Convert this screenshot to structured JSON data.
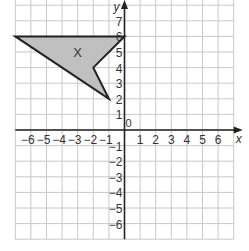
{
  "chart_data": {
    "type": "scatter",
    "title": "",
    "xlabel": "x",
    "ylabel": "y",
    "xlim": [
      -7,
      7
    ],
    "ylim": [
      -7,
      8
    ],
    "grid": true,
    "x_ticks": [
      -6,
      -5,
      -4,
      -3,
      -2,
      -1,
      1,
      2,
      3,
      4,
      5,
      6
    ],
    "y_ticks": [
      -6,
      -5,
      -4,
      -3,
      -2,
      -1,
      1,
      2,
      3,
      4,
      5,
      6,
      7
    ],
    "origin_label": "0",
    "shapes": [
      {
        "name": "X",
        "label": "X",
        "vertices": [
          [
            -7,
            6
          ],
          [
            0,
            6
          ],
          [
            -2,
            4
          ],
          [
            -1,
            2
          ]
        ],
        "fill": "#c0c0c0",
        "stroke": "#222222",
        "label_pos": [
          -3,
          5
        ]
      }
    ]
  },
  "colors": {
    "grid": "#c8c8c8",
    "axis": "#222222",
    "text": "#333333"
  }
}
